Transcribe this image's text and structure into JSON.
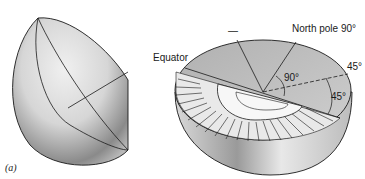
{
  "figure": {
    "panel_label": "(a)",
    "labels": {
      "north_pole": "North pole 90°",
      "equator": "Equator",
      "angle_inner": "90°",
      "angle_right_outer": "45°",
      "angle_right_inner": "45°",
      "dash_mark": "—"
    }
  },
  "colors": {
    "ink": "#1a1a1a",
    "surface_light": "#e6e6e6",
    "surface_mid": "#bdbdbd",
    "surface_dark": "#7a7a7a",
    "wedge_dark": "#9e9e9e",
    "protractor": "#f7f7f7"
  }
}
